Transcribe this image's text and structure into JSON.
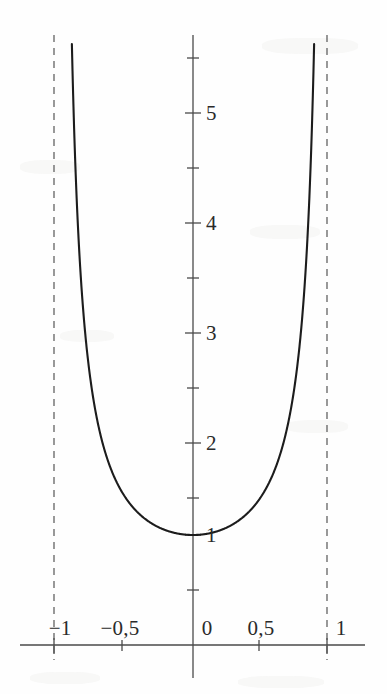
{
  "chart_data": {
    "type": "line",
    "title": "",
    "subtitle": "",
    "xlabel": "",
    "ylabel": "",
    "function": "y = 1/(1 - x^2)",
    "xlim": [
      -1.29,
      1.45
    ],
    "ylim": [
      -0.3,
      5.55
    ],
    "grid": false,
    "legend": null,
    "decimal_separator": ",",
    "x_ticks": [
      {
        "value": -1,
        "label": "−1",
        "major": true
      },
      {
        "value": -0.5,
        "label": "−0,5",
        "major": true
      },
      {
        "value": 0,
        "label": "0",
        "major": true
      },
      {
        "value": 0.5,
        "label": "0,5",
        "major": true
      },
      {
        "value": 1,
        "label": "1",
        "major": true
      }
    ],
    "y_ticks": [
      {
        "value": 0.5,
        "label": "",
        "major": false
      },
      {
        "value": 1,
        "label": "1",
        "major": true
      },
      {
        "value": 1.5,
        "label": "",
        "major": false
      },
      {
        "value": 2,
        "label": "2",
        "major": true
      },
      {
        "value": 2.5,
        "label": "",
        "major": false
      },
      {
        "value": 3,
        "label": "3",
        "major": true
      },
      {
        "value": 3.5,
        "label": "",
        "major": false
      },
      {
        "value": 4,
        "label": "4",
        "major": true
      },
      {
        "value": 4.5,
        "label": "",
        "major": false
      },
      {
        "value": 5,
        "label": "5",
        "major": true
      },
      {
        "value": 5.5,
        "label": "",
        "major": false
      },
      {
        "value": -0.5,
        "label": "",
        "major": false
      }
    ],
    "asymptotes": [
      {
        "type": "vertical",
        "value": -1,
        "style": "dashed"
      },
      {
        "type": "vertical",
        "value": 1,
        "style": "dashed"
      }
    ],
    "series": [
      {
        "name": "y = 1/(1 - x^2)",
        "color": "#1c1c1c",
        "style": "solid",
        "branches": [
          {
            "name": "left-branch",
            "points": [
              [
                -0.946,
                5.55
              ],
              [
                -0.94,
                4.76
              ],
              [
                -0.93,
                4.11
              ],
              [
                -0.92,
                3.65
              ],
              [
                -0.9,
                2.99
              ],
              [
                -0.88,
                2.55
              ],
              [
                -0.86,
                2.23
              ],
              [
                -0.84,
                1.99
              ],
              [
                -0.8,
                1.64
              ],
              [
                -0.76,
                1.41
              ],
              [
                -0.72,
                1.25
              ],
              [
                -0.68,
                1.13
              ],
              [
                -0.64,
                1.04
              ],
              [
                -0.6,
                0.98
              ],
              [
                -0.5,
                0.88
              ],
              [
                -0.4,
                0.84
              ],
              [
                -0.3,
                0.82
              ],
              [
                -0.2,
                0.81
              ],
              [
                -0.1,
                0.8
              ],
              [
                0,
                0.8
              ]
            ]
          },
          {
            "name": "right-branch",
            "points": [
              [
                0,
                0.8
              ],
              [
                0.1,
                0.8
              ],
              [
                0.2,
                0.81
              ],
              [
                0.3,
                0.82
              ],
              [
                0.4,
                0.84
              ],
              [
                0.5,
                0.88
              ],
              [
                0.6,
                0.98
              ],
              [
                0.64,
                1.04
              ],
              [
                0.68,
                1.13
              ],
              [
                0.72,
                1.25
              ],
              [
                0.76,
                1.41
              ],
              [
                0.8,
                1.64
              ],
              [
                0.84,
                1.99
              ],
              [
                0.86,
                2.23
              ],
              [
                0.88,
                2.55
              ],
              [
                0.9,
                2.99
              ],
              [
                0.92,
                3.65
              ],
              [
                0.93,
                4.11
              ],
              [
                0.94,
                4.76
              ],
              [
                0.946,
                5.55
              ]
            ]
          }
        ]
      }
    ],
    "axes": {
      "x_axis": {
        "from": -1.29,
        "to": 1.28,
        "y": 0
      },
      "y_axis": {
        "from": -0.3,
        "to": 5.55,
        "x": 0
      }
    },
    "colors": {
      "curve": "#1c1c1c",
      "axis": "#4a4a4a",
      "asymptote": "#555555",
      "text": "#2a2a2a",
      "background": "#fefefe"
    }
  }
}
